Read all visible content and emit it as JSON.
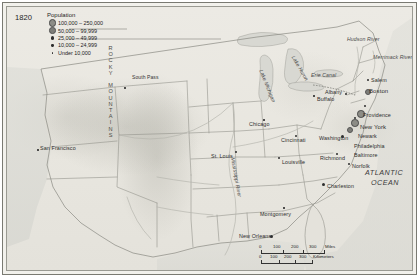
{
  "map": {
    "year": "1820",
    "legend": {
      "title": "Population",
      "classes": [
        {
          "label": "100,000 – 250,000",
          "symbol": "dot-xl"
        },
        {
          "label": "50,000 – 99,999",
          "symbol": "dot-lg"
        },
        {
          "label": "25,000 – 49,999",
          "symbol": "dot-md"
        },
        {
          "label": "10,000 – 24,999",
          "symbol": "dot-sm"
        },
        {
          "label": "Under 10,000",
          "symbol": "dot-xs"
        }
      ]
    },
    "ocean_labels": [
      {
        "name": "ATLANTIC OCEAN",
        "line1": "ATLANTIC",
        "line2": "OCEAN"
      }
    ],
    "water_features": [
      {
        "name": "Lake Michigan"
      },
      {
        "name": "Lake Huron"
      },
      {
        "name": "Hudson River"
      },
      {
        "name": "Merrimack River"
      },
      {
        "name": "Mississippi River"
      },
      {
        "name": "Erie Canal"
      }
    ],
    "physical_features": [
      {
        "name": "South Pass"
      },
      {
        "name": "ROCKY MOUNTAINS"
      }
    ],
    "cities": [
      {
        "name": "San Francisco",
        "size": "dot-xs"
      },
      {
        "name": "St. Louis",
        "size": "dot-sm"
      },
      {
        "name": "Chicago",
        "size": "dot-xs"
      },
      {
        "name": "Cincinnati",
        "size": "dot-sm"
      },
      {
        "name": "Louisville",
        "size": "dot-sm"
      },
      {
        "name": "Washington",
        "size": "dot-md"
      },
      {
        "name": "Richmond",
        "size": "dot-sm"
      },
      {
        "name": "Norfolk",
        "size": "dot-sm"
      },
      {
        "name": "Baltimore",
        "size": "dot-lg"
      },
      {
        "name": "Philadelphia",
        "size": "dot-xl"
      },
      {
        "name": "New York",
        "size": "dot-xl"
      },
      {
        "name": "Newark",
        "size": "dot-sm"
      },
      {
        "name": "Providence",
        "size": "dot-sm"
      },
      {
        "name": "Boston",
        "size": "dot-lg"
      },
      {
        "name": "Salem",
        "size": "dot-sm"
      },
      {
        "name": "Albany",
        "size": "dot-sm"
      },
      {
        "name": "Buffalo",
        "size": "dot-xs"
      },
      {
        "name": "Charleston",
        "size": "dot-md"
      },
      {
        "name": "New Orleans",
        "size": "dot-md"
      },
      {
        "name": "Montgomery",
        "size": "dot-xs"
      }
    ],
    "scale": {
      "miles": {
        "ticks": [
          "0",
          "100",
          "200",
          "300"
        ],
        "unit": "Miles"
      },
      "kilometers": {
        "ticks": [
          "0",
          "100",
          "200",
          "300"
        ],
        "unit": "Kilometers"
      }
    },
    "colors": {
      "land": "#e9e7e0",
      "water": "#dcdcd6",
      "border": "#8a8a82",
      "dot": "#2e2e2e",
      "text": "#2d2d2d"
    }
  }
}
